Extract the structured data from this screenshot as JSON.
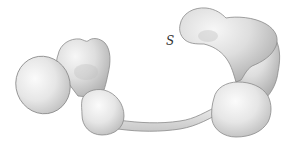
{
  "figure": {
    "label": "S",
    "colors": {
      "fill_light": "#f4f4f4",
      "fill_mid": "#dcdcdc",
      "fill_dark": "#b8b8b8",
      "outline": "#8a8a8a",
      "label": "#333333"
    },
    "parts": [
      {
        "name": "left-oval-lobe"
      },
      {
        "name": "left-upper-lobe"
      },
      {
        "name": "left-lower-lobe"
      },
      {
        "name": "tether"
      },
      {
        "name": "right-top-lobe"
      },
      {
        "name": "right-column-lobe"
      },
      {
        "name": "right-bottom-lobe"
      }
    ]
  }
}
